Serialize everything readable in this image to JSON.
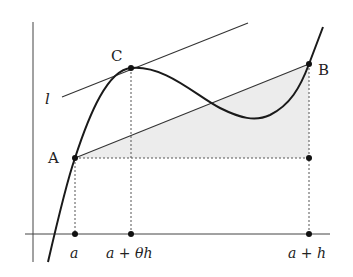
{
  "diagram": {
    "type": "mean-value-theorem",
    "points": {
      "A": {
        "label": "A"
      },
      "B": {
        "label": "B"
      },
      "C": {
        "label": "C"
      }
    },
    "tangent_line_label": "l",
    "x_ticks": [
      {
        "label": "a"
      },
      {
        "label": "a + θh"
      },
      {
        "label": "a + h"
      }
    ],
    "colors": {
      "curve": "#1a1a1a",
      "lines": "#333333",
      "shade": "#ececec",
      "dashed": "#555555"
    }
  }
}
